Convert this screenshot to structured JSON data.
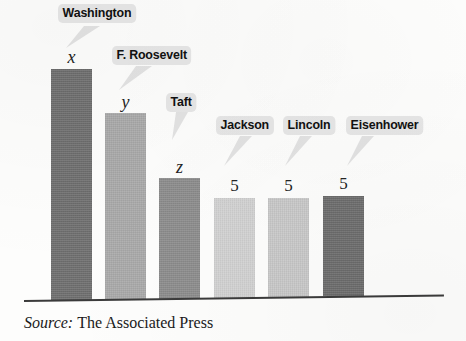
{
  "figure": {
    "type": "bar-chart-scanned",
    "background_color": "#fdfdfc",
    "baseline_color": "#3b3b3b"
  },
  "chart_data": {
    "type": "bar",
    "title": "",
    "subtitle": "",
    "xlabel": "",
    "ylabel": "",
    "grid": false,
    "legend": "none",
    "categories": [
      "Washington",
      "F. Roosevelt",
      "Taft",
      "Jackson",
      "Lincoln",
      "Eisenhower"
    ],
    "value_labels": [
      "x",
      "y",
      "z",
      "5",
      "5",
      "5"
    ],
    "values": [
      10,
      8,
      6,
      5,
      5,
      5
    ],
    "ylim": [
      0,
      10.5
    ],
    "bar_colors": [
      "#6e6e6e",
      "#a9a9a9",
      "#8c8c8c",
      "#d2d2d2",
      "#c9c9c9",
      "#6c6c6c"
    ],
    "annotations": [
      "Bar heights are unlabeled for the first three presidents; they are denoted x, y and z.",
      "Jackson, Lincoln and Eisenhower each have the value 5."
    ]
  },
  "bars": [
    {
      "name": "Washington",
      "value_label": "x",
      "color": "#6e6e6e",
      "left": 51,
      "top": 69,
      "width": 41,
      "height": 232,
      "value_label_left": 51,
      "value_label_top": 48
    },
    {
      "name": "F. Roosevelt",
      "value_label": "y",
      "color": "#a9a9a9",
      "left": 105,
      "top": 113,
      "width": 41,
      "height": 187,
      "value_label_left": 105,
      "value_label_top": 93
    },
    {
      "name": "Taft",
      "value_label": "z",
      "color": "#8c8c8c",
      "left": 159,
      "top": 178,
      "width": 41,
      "height": 121,
      "value_label_left": 159,
      "value_label_top": 158
    },
    {
      "name": "Jackson",
      "value_label": "5",
      "color": "#d2d2d2",
      "left": 214,
      "top": 198,
      "width": 41,
      "height": 100,
      "value_label_left": 214,
      "value_label_top": 177
    },
    {
      "name": "Lincoln",
      "value_label": "5",
      "color": "#c9c9c9",
      "left": 268,
      "top": 198,
      "width": 41,
      "height": 99,
      "value_label_left": 268,
      "value_label_top": 177
    },
    {
      "name": "Eisenhower",
      "value_label": "5",
      "color": "#6c6c6c",
      "left": 323,
      "top": 196,
      "width": 41,
      "height": 100,
      "value_label_left": 323,
      "value_label_top": 175
    }
  ],
  "callouts": [
    {
      "label": "Washington",
      "bubble_left": 58,
      "bubble_top": 4,
      "tail_left": 60,
      "tail_top": 26,
      "tail_path": "M 24 0 L 40 0 L 6 22 Z"
    },
    {
      "label": "F. Roosevelt",
      "bubble_left": 112,
      "bubble_top": 46,
      "tail_left": 114,
      "tail_top": 66,
      "tail_path": "M 22 0 L 38 0 L 5 24 Z"
    },
    {
      "label": "Taft",
      "bubble_left": 166,
      "bubble_top": 93,
      "tail_left": 166,
      "tail_top": 112,
      "tail_path": "M 10 0 L 22 0 L 6 28 Z"
    },
    {
      "label": "Jackson",
      "bubble_left": 216,
      "bubble_top": 116,
      "tail_left": 220,
      "tail_top": 136,
      "tail_path": "M 20 0 L 32 0 L 4 30 Z"
    },
    {
      "label": "Lincoln",
      "bubble_left": 283,
      "bubble_top": 116,
      "tail_left": 282,
      "tail_top": 136,
      "tail_path": "M 18 0 L 30 0 L 3 30 Z"
    },
    {
      "label": "Eisenhower",
      "bubble_left": 346,
      "bubble_top": 116,
      "tail_left": 344,
      "tail_top": 136,
      "tail_path": "M 18 0 L 30 0 L 3 30 Z"
    }
  ],
  "source": {
    "word": "Source:",
    "text": "The Associated Press"
  }
}
